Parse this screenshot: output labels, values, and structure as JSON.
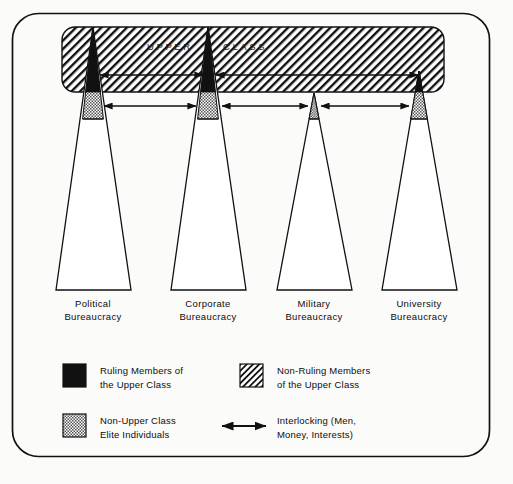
{
  "figure": {
    "type": "diagram",
    "banner": {
      "label_left": "UPPER",
      "label_right": "CLASS",
      "fill": "diagonal-hatch",
      "color": "#111111"
    },
    "pillars": [
      {
        "id": "political",
        "name_line1": "Political",
        "name_line2": "Bureaucracy",
        "apex_x": 93,
        "apex_y": 27,
        "base_left_x": 56,
        "base_right_x": 131,
        "base_y": 290,
        "black_tip_end_y": 92,
        "stipple_end_y": 119,
        "ruling_segment": "large",
        "elite_segment": "large"
      },
      {
        "id": "corporate",
        "name_line1": "Corporate",
        "name_line2": "Bureaucracy",
        "apex_x": 208,
        "apex_y": 27,
        "base_left_x": 171,
        "base_right_x": 246,
        "base_y": 290,
        "black_tip_end_y": 92,
        "stipple_end_y": 119,
        "ruling_segment": "large",
        "elite_segment": "large"
      },
      {
        "id": "military",
        "name_line1": "Military",
        "name_line2": "Bureaucracy",
        "apex_x": 314,
        "apex_y": 93,
        "base_left_x": 277,
        "base_right_x": 352,
        "base_y": 290,
        "black_tip_end_y": 93,
        "stipple_end_y": 119,
        "ruling_segment": "none",
        "elite_segment": "small"
      },
      {
        "id": "university",
        "name_line1": "University",
        "name_line2": "Bureaucracy",
        "apex_x": 419,
        "apex_y": 71,
        "base_left_x": 382,
        "base_right_x": 457,
        "base_y": 290,
        "black_tip_end_y": 92,
        "stipple_end_y": 119,
        "ruling_segment": "small",
        "elite_segment": "large"
      }
    ],
    "interlocks_upper": [
      {
        "from": "political",
        "to": "corporate",
        "x1": 100,
        "x2": 203,
        "y": 75
      },
      {
        "from": "corporate",
        "to": "university",
        "x1": 216,
        "x2": 419,
        "y": 75
      }
    ],
    "interlocks_lower": [
      {
        "from": "political",
        "to": "corporate",
        "x1": 103,
        "x2": 196,
        "y": 106
      },
      {
        "from": "corporate",
        "to": "military",
        "x1": 222,
        "x2": 308,
        "y": 106
      },
      {
        "from": "military",
        "to": "university",
        "x1": 321,
        "x2": 410,
        "y": 106
      }
    ]
  },
  "legend": {
    "items": [
      {
        "swatch": "solid-black",
        "line1": "Ruling Members of",
        "line2": "the Upper Class"
      },
      {
        "swatch": "diagonal-hatch",
        "line1": "Non-Ruling Members",
        "line2": "of the Upper Class"
      },
      {
        "swatch": "stipple",
        "line1": "Non-Upper Class",
        "line2": "Elite Individuals"
      },
      {
        "swatch": "double-arrow",
        "line1": "Interlocking (Men,",
        "line2": "Money, Interests)"
      }
    ]
  },
  "colors": {
    "ink": "#111111",
    "page": "#fbfbf9",
    "hatch": "#111111",
    "stipple": "#8a8a8a"
  }
}
